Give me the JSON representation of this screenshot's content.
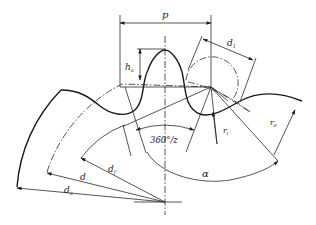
{
  "diagram": {
    "type": "sprocket tooth profile",
    "labels": {
      "pitch": "p",
      "tooth_height": "h",
      "tooth_height_sub": "a",
      "roller_diameter": "d",
      "roller_diameter_sub": "1",
      "seating_radius": "r",
      "seating_radius_sub": "i",
      "tooth_flank_radius": "r",
      "tooth_flank_radius_sub": "e",
      "pitch_angle": "360°/z",
      "pressure_angle": "α",
      "pitch_circle_diameter": "d",
      "root_circle_diameter": "d",
      "root_circle_diameter_sub": "f",
      "tip_circle_diameter": "d",
      "tip_circle_diameter_sub": "a"
    },
    "colors": {
      "line": "#1a1a1a",
      "background": "#ffffff"
    }
  }
}
